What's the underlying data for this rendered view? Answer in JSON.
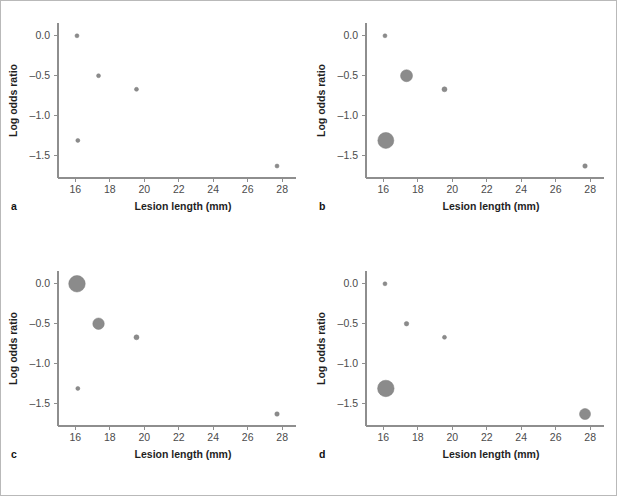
{
  "figure": {
    "panels": [
      {
        "letter": "a",
        "xlabel": "Lesion length (mm)",
        "ylabel": "Log odds ratio"
      },
      {
        "letter": "b",
        "xlabel": "Lesion length (mm)",
        "ylabel": "Log odds ratio"
      },
      {
        "letter": "c",
        "xlabel": "Lesion length (mm)",
        "ylabel": "Log odds ratio"
      },
      {
        "letter": "d",
        "xlabel": "Lesion length (mm)",
        "ylabel": "Log odds ratio"
      }
    ],
    "marker_color": "#8b8b8b",
    "axis_color": "#8e8e8e",
    "border_color": "#b9b9b9"
  },
  "chart_data": [
    {
      "type": "scatter",
      "panel": "a",
      "title": "",
      "xlabel": "Lesion length (mm)",
      "ylabel": "Log odds ratio",
      "xlim": [
        15.0,
        28.8
      ],
      "ylim": [
        -1.78,
        0.16
      ],
      "xticks": [
        16,
        18,
        20,
        22,
        24,
        26,
        28
      ],
      "yticks": [
        0.0,
        -0.5,
        -1.0,
        -1.5
      ],
      "ytick_labels": [
        "0.0",
        "-0.5",
        "-1.0",
        "-1.5"
      ],
      "grid": false,
      "legend": false,
      "x": [
        16.1,
        17.35,
        19.55,
        16.15,
        27.7
      ],
      "y": [
        0.0,
        -0.5,
        -0.67,
        -1.31,
        -1.63
      ],
      "sizes": [
        4,
        4,
        4,
        4,
        4
      ],
      "size_meaning": "uniform marker size (unweighted)"
    },
    {
      "type": "scatter",
      "panel": "b",
      "title": "",
      "xlabel": "Lesion length (mm)",
      "ylabel": "Log odds ratio",
      "xlim": [
        15.0,
        28.8
      ],
      "ylim": [
        -1.78,
        0.16
      ],
      "xticks": [
        16,
        18,
        20,
        22,
        24,
        26,
        28
      ],
      "yticks": [
        0.0,
        -0.5,
        -1.0,
        -1.5
      ],
      "ytick_labels": [
        "0.0",
        "-0.5",
        "-1.0",
        "-1.5"
      ],
      "grid": false,
      "legend": false,
      "x": [
        16.1,
        17.35,
        19.55,
        16.15,
        27.7
      ],
      "y": [
        0.0,
        -0.5,
        -0.67,
        -1.31,
        -1.63
      ],
      "sizes": [
        4,
        12,
        5,
        16,
        4.5
      ],
      "size_meaning": "bubble diameter proportional to study weight"
    },
    {
      "type": "scatter",
      "panel": "c",
      "title": "",
      "xlabel": "Lesion length (mm)",
      "ylabel": "Log odds ratio",
      "xlim": [
        15.0,
        28.8
      ],
      "ylim": [
        -1.78,
        0.16
      ],
      "xticks": [
        16,
        18,
        20,
        22,
        24,
        26,
        28
      ],
      "yticks": [
        0.0,
        -0.5,
        -1.0,
        -1.5
      ],
      "ytick_labels": [
        "0.0",
        "-0.5",
        "-1.0",
        "-1.5"
      ],
      "grid": false,
      "legend": false,
      "x": [
        16.1,
        17.35,
        19.55,
        16.15,
        27.7
      ],
      "y": [
        0.0,
        -0.5,
        -0.67,
        -1.31,
        -1.63
      ],
      "sizes": [
        16.5,
        11.5,
        5,
        4,
        4.5
      ],
      "size_meaning": "bubble diameter proportional to study weight"
    },
    {
      "type": "scatter",
      "panel": "d",
      "title": "",
      "xlabel": "Lesion length (mm)",
      "ylabel": "Log odds ratio",
      "xlim": [
        15.0,
        28.8
      ],
      "ylim": [
        -1.78,
        0.16
      ],
      "xticks": [
        16,
        18,
        20,
        22,
        24,
        26,
        28
      ],
      "yticks": [
        0.0,
        -0.5,
        -1.0,
        -1.5
      ],
      "ytick_labels": [
        "0.0",
        "-0.5",
        "-1.0",
        "-1.5"
      ],
      "grid": false,
      "legend": false,
      "x": [
        16.1,
        17.35,
        19.55,
        16.15,
        27.7
      ],
      "y": [
        0.0,
        -0.5,
        -0.67,
        -1.31,
        -1.63
      ],
      "sizes": [
        4,
        4.5,
        4,
        16.5,
        11
      ],
      "size_meaning": "bubble diameter proportional to study weight"
    }
  ]
}
